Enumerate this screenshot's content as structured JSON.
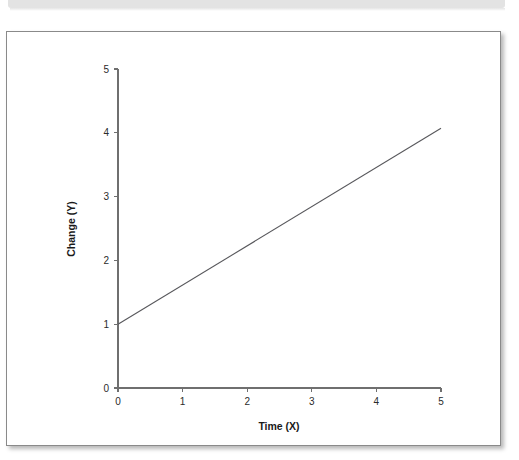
{
  "page": {
    "background_color": "#ffffff",
    "top_band_color": "#e3e3e3"
  },
  "figure": {
    "border_color": "#8a8a8a",
    "background_color": "#ffffff"
  },
  "chart_data": {
    "type": "line",
    "title": "",
    "subtitle": "",
    "xlabel": "Time (X)",
    "ylabel": "Change (Y)",
    "xlim": [
      0,
      5
    ],
    "ylim": [
      0,
      5
    ],
    "x_ticks": [
      0,
      1,
      2,
      3,
      4,
      5
    ],
    "y_ticks": [
      0,
      1,
      2,
      3,
      4,
      5
    ],
    "x_tick_labels": [
      "0",
      "1",
      "2",
      "3",
      "4",
      "5"
    ],
    "y_tick_labels": [
      "0",
      "1",
      "2",
      "3",
      "4",
      "5"
    ],
    "grid": false,
    "legend": false,
    "legend_position": "none",
    "line_color": "#58585c",
    "series": [
      {
        "name": "linear change",
        "x": [
          0,
          5
        ],
        "values": [
          1,
          4.07
        ],
        "intercept": 1,
        "slope": 0.614
      }
    ]
  }
}
